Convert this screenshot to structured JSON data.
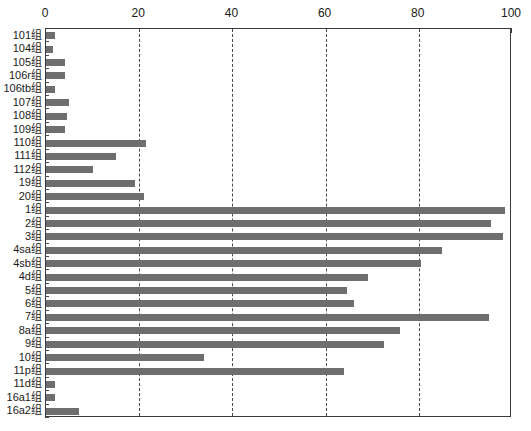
{
  "chart_data": {
    "type": "bar",
    "orientation": "horizontal",
    "title": "",
    "subtitle": "",
    "xlabel": "",
    "ylabel": "",
    "xlim": [
      0,
      100
    ],
    "ylim": null,
    "grid": true,
    "grid_axis": "x",
    "legend": null,
    "legend_position": "none",
    "bar_color": "#6e6e6e",
    "axis_color": "#3a3a3a",
    "background": "#ffffff",
    "xticks": [
      0,
      20,
      40,
      60,
      80,
      100
    ],
    "xtick_labels": [
      "0",
      "20",
      "40",
      "60",
      "80",
      "100"
    ],
    "xminor_ticks": [
      10,
      30,
      50,
      70,
      90
    ],
    "xaxis_position": "top",
    "categories": [
      "101组",
      "104组",
      "105组",
      "106r组",
      "106tb组",
      "107组",
      "108组",
      "109组",
      "110组",
      "111组",
      "112组",
      "19组",
      "20组",
      "1组",
      "2组",
      "3组",
      "4sa组",
      "4sb组",
      "4d组",
      "5组",
      "6组",
      "7组",
      "8a组",
      "9组",
      "10组",
      "11p组",
      "11d组",
      "16a1组",
      "16a2组"
    ],
    "values": [
      2,
      1.5,
      4,
      4,
      2,
      5,
      4.5,
      4,
      21.5,
      15,
      10,
      19,
      21,
      98.5,
      95.5,
      98,
      85,
      80.5,
      69,
      64.5,
      66,
      95,
      76,
      72.5,
      34,
      64,
      2,
      2,
      7
    ]
  }
}
